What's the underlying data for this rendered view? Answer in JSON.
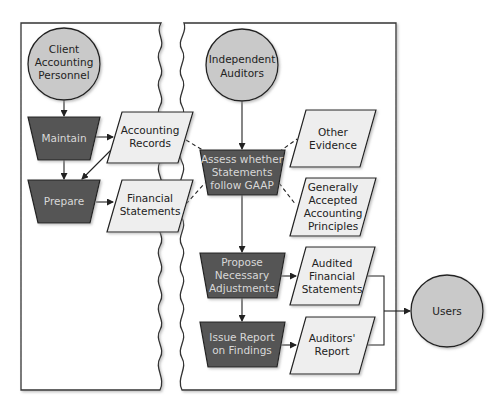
{
  "colors": {
    "process_fill": "#555555",
    "document_fill": "#eeeeee",
    "entity_fill": "#c9c9c9",
    "stroke": "#222222",
    "panel_stroke": "#333333"
  },
  "entities": {
    "client": {
      "line1": "Client",
      "line2": "Accounting",
      "line3": "Personnel"
    },
    "auditors": {
      "line1": "Independent",
      "line2": "Auditors"
    },
    "users": {
      "line1": "Users"
    }
  },
  "processes": {
    "maintain": {
      "line1": "Maintain"
    },
    "prepare": {
      "line1": "Prepare"
    },
    "assess": {
      "line1": "Assess whether",
      "line2": "Statements",
      "line3": "follow GAAP"
    },
    "propose": {
      "line1": "Propose",
      "line2": "Necessary",
      "line3": "Adjustments"
    },
    "issue": {
      "line1": "Issue Report",
      "line2": "on Findings"
    }
  },
  "documents": {
    "accounting_records": {
      "line1": "Accounting",
      "line2": "Records"
    },
    "financial_statements": {
      "line1": "Financial",
      "line2": "Statements"
    },
    "other_evidence": {
      "line1": "Other",
      "line2": "Evidence"
    },
    "gaap": {
      "line1": "Generally",
      "line2": "Accepted",
      "line3": "Accounting",
      "line4": "Principles"
    },
    "audited_fs": {
      "line1": "Audited",
      "line2": "Financial",
      "line3": "Statements"
    },
    "auditors_report": {
      "line1": "Auditors'",
      "line2": "Report"
    }
  }
}
